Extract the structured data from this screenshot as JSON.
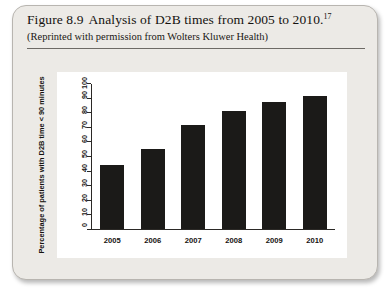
{
  "figure": {
    "caption_label": "Figure 8.9",
    "caption_text": "Analysis of D2B times from 2005 to 2010.",
    "footnote_marker": "17",
    "attribution": "(Reprinted with permission from Wolters Kluwer Health)"
  },
  "colors": {
    "bar": "#1b1a18",
    "panel_background": "#ffffff",
    "card_background": "#eceae6",
    "axis": "#2b2926"
  },
  "chart_data": {
    "type": "bar",
    "title": "",
    "xlabel": "",
    "ylabel": "Percentage of patients with D2B time < 90 minutes",
    "categories": [
      "2005",
      "2006",
      "2007",
      "2008",
      "2009",
      "2010"
    ],
    "values": [
      44,
      55,
      72,
      81.5,
      87.5,
      91.5
    ],
    "ylim": [
      0,
      100
    ],
    "yticks": [
      0,
      10,
      20,
      30,
      40,
      50,
      60,
      70,
      80,
      90,
      100
    ],
    "ytick_labels": [
      "0",
      "10",
      "20",
      "30",
      "40",
      "50",
      "60",
      "70",
      "80",
      "90",
      "100"
    ],
    "grid": false,
    "legend": false
  }
}
